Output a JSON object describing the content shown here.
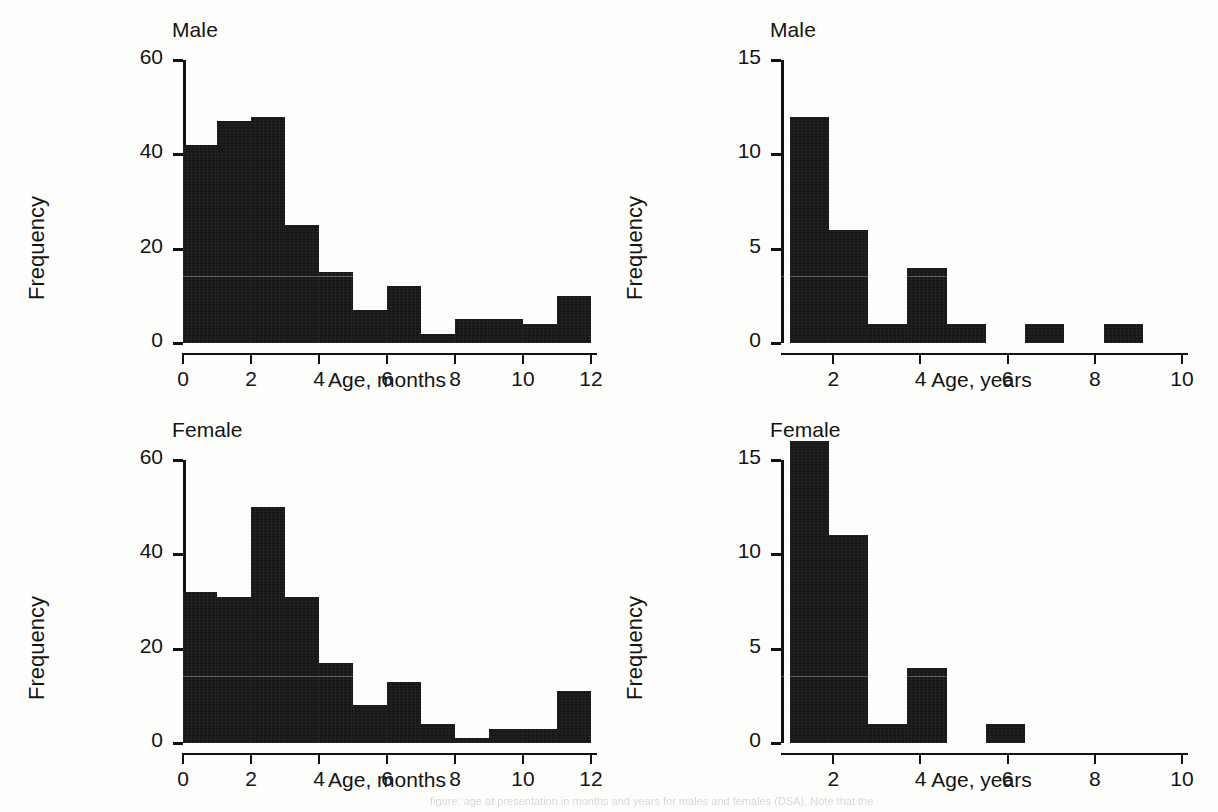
{
  "figure": {
    "background_color": "#fdfdfb",
    "bar_color": "#171717",
    "axis_color": "#111111",
    "footer_faint_text": "figure: age at presentation in months and years for males and females (DSA). Note that the"
  },
  "chart_data": [
    {
      "id": "male-months",
      "type": "bar",
      "title": "Male",
      "xlabel": "Age, months",
      "ylabel": "Frequency",
      "xlim": [
        0,
        12
      ],
      "ylim": [
        0,
        60
      ],
      "xticks": [
        0,
        2,
        4,
        6,
        8,
        10,
        12
      ],
      "yticks": [
        0,
        20,
        40,
        60
      ],
      "xtick_labels": [
        "0",
        "2",
        "4",
        "6",
        "8",
        "10",
        "12"
      ],
      "ytick_labels": [
        "0",
        "20",
        "40",
        "60"
      ],
      "bin_width": 1,
      "bin_edges": [
        0,
        1,
        2,
        3,
        4,
        5,
        6,
        7,
        8,
        9,
        10,
        11,
        12
      ],
      "categories": [
        "0-1",
        "1-2",
        "2-3",
        "3-4",
        "4-5",
        "5-6",
        "6-7",
        "7-8",
        "8-9",
        "9-10",
        "10-11",
        "11-12"
      ],
      "values": [
        42,
        47,
        48,
        25,
        15,
        7,
        12,
        2,
        5,
        5,
        4,
        10
      ],
      "grid": false,
      "legend": "none"
    },
    {
      "id": "male-years",
      "type": "bar",
      "title": "Male",
      "xlabel": "Age, years",
      "ylabel": "Frequency",
      "xlim": [
        0.8,
        10
      ],
      "ylim": [
        0,
        15
      ],
      "xticks": [
        2,
        4,
        6,
        8,
        10
      ],
      "yticks": [
        0,
        5,
        10,
        15
      ],
      "xtick_labels": [
        "2",
        "4",
        "6",
        "8",
        "10"
      ],
      "ytick_labels": [
        "0",
        "5",
        "10",
        "15"
      ],
      "bin_width": 0.9,
      "bin_edges": [
        1.0,
        1.9,
        2.8,
        3.7,
        4.6,
        5.5,
        6.4,
        7.3,
        8.2,
        9.1
      ],
      "categories": [
        "1.0-1.9",
        "1.9-2.8",
        "2.8-3.7",
        "3.7-4.6",
        "4.6-5.5",
        "5.5-6.4",
        "6.4-7.3",
        "7.3-8.2",
        "8.2-9.1"
      ],
      "values": [
        12,
        6,
        1,
        4,
        1,
        0,
        1,
        0,
        1
      ],
      "grid": false,
      "legend": "none"
    },
    {
      "id": "female-months",
      "type": "bar",
      "title": "Female",
      "xlabel": "Age, months",
      "ylabel": "Frequency",
      "xlim": [
        0,
        12
      ],
      "ylim": [
        0,
        60
      ],
      "xticks": [
        0,
        2,
        4,
        6,
        8,
        10,
        12
      ],
      "yticks": [
        0,
        20,
        40,
        60
      ],
      "xtick_labels": [
        "0",
        "2",
        "4",
        "6",
        "8",
        "10",
        "12"
      ],
      "ytick_labels": [
        "0",
        "20",
        "40",
        "60"
      ],
      "bin_width": 1,
      "bin_edges": [
        0,
        1,
        2,
        3,
        4,
        5,
        6,
        7,
        8,
        9,
        10,
        11,
        12
      ],
      "categories": [
        "0-1",
        "1-2",
        "2-3",
        "3-4",
        "4-5",
        "5-6",
        "6-7",
        "7-8",
        "8-9",
        "9-10",
        "10-11",
        "11-12"
      ],
      "values": [
        32,
        31,
        50,
        31,
        17,
        8,
        13,
        4,
        1,
        3,
        3,
        11
      ],
      "grid": false,
      "legend": "none"
    },
    {
      "id": "female-years",
      "type": "bar",
      "title": "Female",
      "xlabel": "Age, years",
      "ylabel": "Frequency",
      "xlim": [
        0.8,
        10
      ],
      "ylim": [
        0,
        15
      ],
      "xticks": [
        2,
        4,
        6,
        8,
        10
      ],
      "yticks": [
        0,
        5,
        10,
        15
      ],
      "xtick_labels": [
        "2",
        "4",
        "6",
        "8",
        "10"
      ],
      "ytick_labels": [
        "0",
        "5",
        "10",
        "15"
      ],
      "bin_width": 0.9,
      "bin_edges": [
        1.0,
        1.9,
        2.8,
        3.7,
        4.6,
        5.5,
        6.4
      ],
      "categories": [
        "1.0-1.9",
        "1.9-2.8",
        "2.8-3.7",
        "3.7-4.6",
        "4.6-5.5",
        "5.5-6.4"
      ],
      "values": [
        16,
        11,
        1,
        4,
        0,
        1
      ],
      "grid": false,
      "legend": "none"
    }
  ]
}
